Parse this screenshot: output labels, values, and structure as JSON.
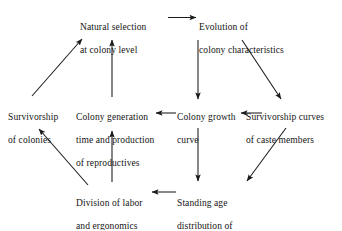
{
  "diagram": {
    "background_color": "#ffffff",
    "text_color": "#141414",
    "line_color": "#1a1a1a",
    "nodes": [
      {
        "id": "natural-selection",
        "name": "natural-selection-at-colony-level",
        "lines": [
          "Natural selection",
          "at colony level"
        ],
        "align": "left"
      },
      {
        "id": "evolution",
        "name": "evolution-of-colony-characteristics",
        "lines": [
          "Evolution of",
          "colony characteristics"
        ],
        "align": "left"
      },
      {
        "id": "survivorship-colonies",
        "name": "survivorship-of-colonies",
        "lines": [
          "Survivorship",
          "of colonies"
        ],
        "align": "left"
      },
      {
        "id": "colony-generation",
        "name": "colony-generation-time-and-production-of-reproductives",
        "lines": [
          "Colony generation",
          "time and production",
          "of reproductives"
        ],
        "align": "left"
      },
      {
        "id": "colony-growth",
        "name": "colony-growth-curve",
        "lines": [
          "Colony growth",
          "curve"
        ],
        "align": "left"
      },
      {
        "id": "survivorship-caste",
        "name": "survivorship-curves-of-caste-members",
        "lines": [
          "Survivorship curves",
          "of caste members"
        ],
        "align": "left"
      },
      {
        "id": "division-labor",
        "name": "division-of-labor-and-ergonomics",
        "lines": [
          "Division of labor",
          "and ergonomics"
        ],
        "align": "left"
      },
      {
        "id": "standing-age",
        "name": "standing-age-distribution-of-caste-members",
        "lines": [
          "Standing age",
          "distribution of",
          "caste members"
        ],
        "align": "left"
      }
    ],
    "edges": [
      {
        "name": "arrow-natural-selection-to-evolution",
        "from": "natural-selection",
        "to": "evolution",
        "direction": "right"
      },
      {
        "name": "arrow-evolution-to-colony-growth",
        "from": "evolution",
        "to": "colony-growth",
        "direction": "down"
      },
      {
        "name": "arrow-evolution-to-survivorship-caste",
        "from": "evolution",
        "to": "survivorship-caste",
        "direction": "down-right"
      },
      {
        "name": "arrow-survivorship-caste-to-colony-growth",
        "from": "survivorship-caste",
        "to": "colony-growth",
        "direction": "left"
      },
      {
        "name": "arrow-colony-growth-to-colony-generation",
        "from": "colony-growth",
        "to": "colony-generation",
        "direction": "left"
      },
      {
        "name": "arrow-colony-growth-to-standing-age",
        "from": "colony-growth",
        "to": "standing-age",
        "direction": "down"
      },
      {
        "name": "arrow-survivorship-caste-to-standing-age",
        "from": "survivorship-caste",
        "to": "standing-age",
        "direction": "down-left"
      },
      {
        "name": "arrow-standing-age-to-division-labor",
        "from": "standing-age",
        "to": "division-labor",
        "direction": "left"
      },
      {
        "name": "arrow-division-labor-to-survivorship-colonies",
        "from": "division-labor",
        "to": "survivorship-colonies",
        "direction": "up-left"
      },
      {
        "name": "arrow-division-labor-to-colony-generation",
        "from": "division-labor",
        "to": "colony-generation",
        "direction": "up"
      },
      {
        "name": "arrow-colony-generation-to-natural-selection",
        "from": "colony-generation",
        "to": "natural-selection",
        "direction": "up"
      },
      {
        "name": "arrow-survivorship-colonies-to-natural-selection",
        "from": "survivorship-colonies",
        "to": "natural-selection",
        "direction": "up-right"
      }
    ]
  }
}
